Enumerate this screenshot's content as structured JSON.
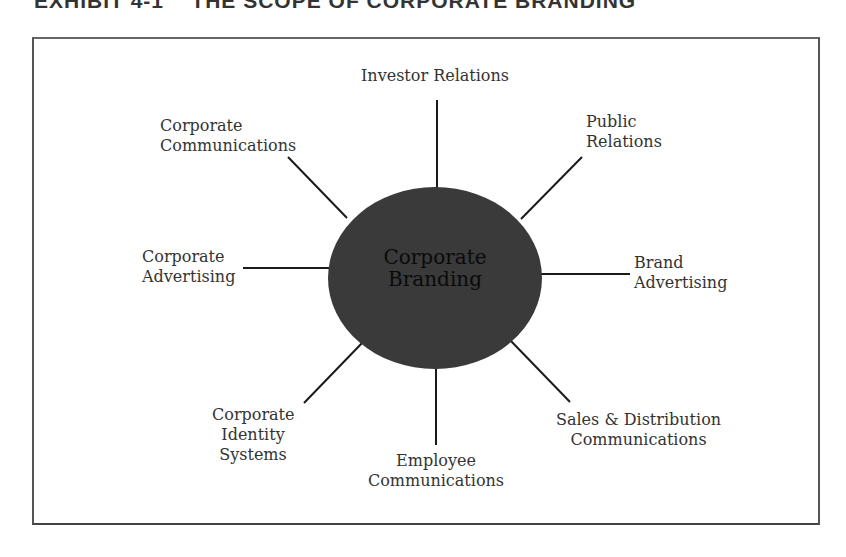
{
  "title": "EXHIBIT 4-1    THE SCOPE OF CORPORATE BRANDING",
  "center": {
    "line1": "Corporate",
    "line2": "Branding",
    "fill": "#3a3a3a"
  },
  "spokes": [
    {
      "id": "investor-relations",
      "lines": [
        "Investor Relations"
      ]
    },
    {
      "id": "public-relations",
      "lines": [
        "Public",
        "Relations"
      ]
    },
    {
      "id": "brand-advertising",
      "lines": [
        "Brand",
        "Advertising"
      ]
    },
    {
      "id": "sales-distribution-communications",
      "lines": [
        "Sales & Distribution",
        "Communications"
      ]
    },
    {
      "id": "employee-communications",
      "lines": [
        "Employee",
        "Communications"
      ]
    },
    {
      "id": "corporate-identity-systems",
      "lines": [
        "Corporate",
        "Identity",
        "Systems"
      ]
    },
    {
      "id": "corporate-advertising",
      "lines": [
        "Corporate",
        "Advertising"
      ]
    },
    {
      "id": "corporate-communications",
      "lines": [
        "Corporate",
        "Communications"
      ]
    }
  ]
}
